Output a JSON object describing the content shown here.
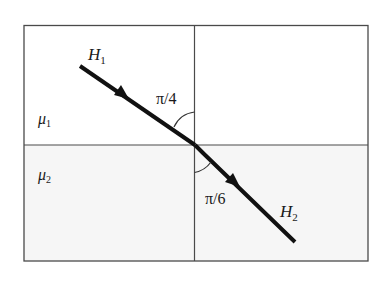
{
  "diagram": {
    "type": "refraction-of-magnetic-field-lines",
    "media": {
      "upper": {
        "label": "μ",
        "subscript": "1",
        "fill": "#ffffff"
      },
      "lower": {
        "label": "μ",
        "subscript": "2",
        "fill": "#f6f6f6"
      }
    },
    "field_lines": {
      "incident": {
        "label": "H",
        "subscript": "1"
      },
      "refracted": {
        "label": "H",
        "subscript": "2"
      }
    },
    "angles": {
      "incident": {
        "label": "π/4"
      },
      "refracted": {
        "label": "π/6"
      }
    },
    "colors": {
      "frame": "#4a4a4a",
      "ray": "#111111",
      "text": "#1a1a1a"
    }
  }
}
